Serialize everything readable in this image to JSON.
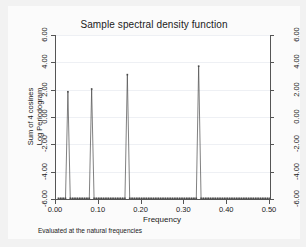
{
  "chart_data": {
    "type": "line",
    "title": "Sample spectral density function",
    "xlabel": "Frequency",
    "ylabel_left_outer": "Sum of 4 cosines",
    "ylabel_left_inner": "Log Periodogram",
    "note": "Evaluated at the natural frequencies",
    "xlim": [
      0.0,
      0.5
    ],
    "ylim": [
      -6.0,
      6.0
    ],
    "grid": true,
    "legend": "none",
    "xticks": [
      0.0,
      0.1,
      0.2,
      0.3,
      0.4,
      0.5
    ],
    "xtick_labels": [
      "0.00",
      "0.10",
      "0.20",
      "0.30",
      "0.40",
      "0.50"
    ],
    "yticks": [
      -6.0,
      -4.0,
      -2.0,
      0.0,
      2.0,
      4.0,
      6.0
    ],
    "ytick_labels": [
      "-6.00",
      "-4.00",
      "-2.00",
      "0.00",
      "2.00",
      "4.00",
      "6.00"
    ],
    "right_axis_yticks": [
      -6.0,
      -4.0,
      -2.0,
      0.0,
      2.0,
      4.0,
      6.0
    ],
    "right_axis_ytick_labels": [
      "-6.00",
      "-4.00",
      "-2.00",
      "0.00",
      "2.00",
      "4.00",
      "6.00"
    ],
    "baseline_value": -5.95,
    "marker": "square",
    "peaks": [
      {
        "x": 0.0278,
        "y": 1.85
      },
      {
        "x": 0.0833,
        "y": 2.05
      },
      {
        "x": 0.1667,
        "y": 3.1
      },
      {
        "x": 0.3333,
        "y": 3.72
      }
    ],
    "x": [
      0.0056,
      0.0111,
      0.0167,
      0.0222,
      0.0278,
      0.0333,
      0.0389,
      0.0444,
      0.05,
      0.0556,
      0.0611,
      0.0667,
      0.0722,
      0.0778,
      0.0833,
      0.0889,
      0.0944,
      0.1,
      0.1056,
      0.1111,
      0.1167,
      0.1222,
      0.1278,
      0.1333,
      0.1389,
      0.1444,
      0.15,
      0.1556,
      0.1611,
      0.1667,
      0.1722,
      0.1778,
      0.1833,
      0.1889,
      0.1944,
      0.2,
      0.2056,
      0.2111,
      0.2167,
      0.2222,
      0.2278,
      0.2333,
      0.2389,
      0.2444,
      0.25,
      0.2556,
      0.2611,
      0.2667,
      0.2722,
      0.2778,
      0.2833,
      0.2889,
      0.2944,
      0.3,
      0.3056,
      0.3111,
      0.3167,
      0.3222,
      0.3278,
      0.3333,
      0.3389,
      0.3444,
      0.35,
      0.3556,
      0.3611,
      0.3667,
      0.3722,
      0.3778,
      0.3833,
      0.3889,
      0.3944,
      0.4,
      0.4056,
      0.4111,
      0.4167,
      0.4222,
      0.4278,
      0.4333,
      0.4389,
      0.4444,
      0.45,
      0.4556,
      0.4611,
      0.4667,
      0.4722,
      0.4778,
      0.4833,
      0.4889,
      0.4944,
      0.5
    ],
    "y": [
      -5.95,
      -5.95,
      -5.95,
      -5.95,
      1.85,
      -5.95,
      -5.95,
      -5.95,
      -5.95,
      -5.95,
      -5.95,
      -5.95,
      -5.95,
      -5.95,
      2.05,
      -5.95,
      -5.95,
      -5.95,
      -5.95,
      -5.95,
      -5.95,
      -5.95,
      -5.95,
      -5.95,
      -5.95,
      -5.95,
      -5.95,
      -5.95,
      -5.95,
      3.1,
      -5.95,
      -5.95,
      -5.95,
      -5.95,
      -5.95,
      -5.95,
      -5.95,
      -5.95,
      -5.95,
      -5.95,
      -5.95,
      -5.95,
      -5.95,
      -5.95,
      -5.95,
      -5.95,
      -5.95,
      -5.95,
      -5.95,
      -5.95,
      -5.95,
      -5.95,
      -5.95,
      -5.95,
      -5.95,
      -5.95,
      -5.95,
      -5.95,
      -5.95,
      3.72,
      -5.95,
      -5.95,
      -5.95,
      -5.95,
      -5.95,
      -5.95,
      -5.95,
      -5.95,
      -5.95,
      -5.95,
      -5.95,
      -5.95,
      -5.95,
      -5.95,
      -5.95,
      -5.95,
      -5.95,
      -5.95,
      -5.95,
      -5.95,
      -5.95,
      -5.95,
      -5.95,
      -5.95,
      -5.95,
      -5.95,
      -5.95,
      -5.95,
      -5.95,
      -5.95
    ]
  },
  "colors": {
    "background": "#f2f2f2",
    "plot_background": "#ffffff",
    "line": "#4a4a4a",
    "axis": "#555555",
    "grid": "#eef0f4",
    "text": "#1a1a1a"
  }
}
